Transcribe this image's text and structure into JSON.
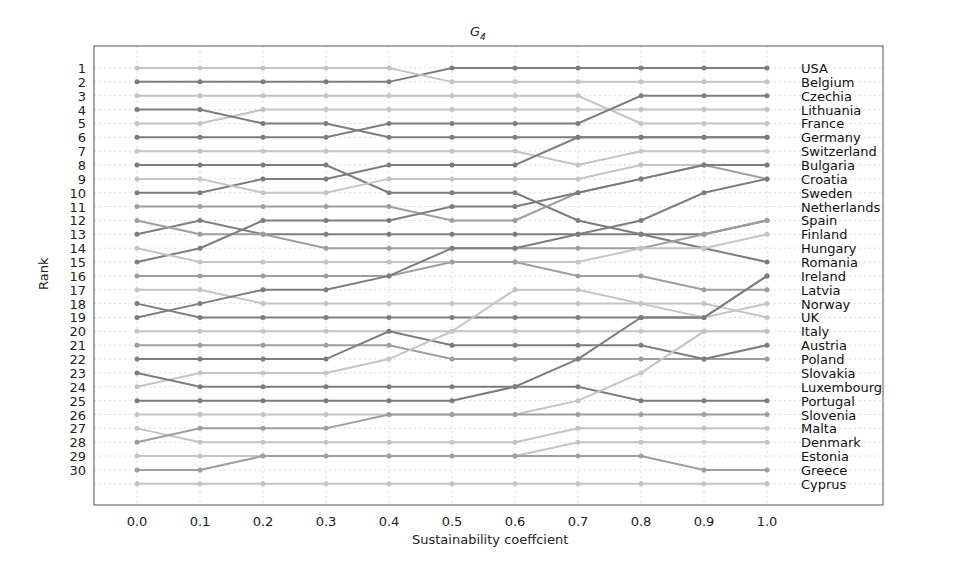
{
  "chart_data": {
    "type": "line",
    "title": "G4",
    "title_main": "G",
    "title_sub": "4",
    "xlabel": "Sustainability coeffcient",
    "ylabel": "Rank",
    "x": [
      0.0,
      0.1,
      0.2,
      0.3,
      0.4,
      0.5,
      0.6,
      0.7,
      0.8,
      0.9,
      1.0
    ],
    "x_tick_labels": [
      "0.0",
      "0.1",
      "0.2",
      "0.3",
      "0.4",
      "0.5",
      "0.6",
      "0.7",
      "0.8",
      "0.9",
      "1.0"
    ],
    "y_tick_labels": [
      "1",
      "2",
      "3",
      "4",
      "5",
      "6",
      "7",
      "8",
      "9",
      "10",
      "11",
      "12",
      "13",
      "14",
      "15",
      "16",
      "17",
      "18",
      "19",
      "20",
      "21",
      "22",
      "23",
      "24",
      "25",
      "26",
      "27",
      "28",
      "29",
      "30"
    ],
    "ylim": [
      1,
      31
    ],
    "y_inverted": true,
    "grid": true,
    "right_labels": [
      "USA",
      "Belgium",
      "Czechia",
      "Lithuania",
      "France",
      "Germany",
      "Switzerland",
      "Bulgaria",
      "Croatia",
      "Sweden",
      "Netherlands",
      "Spain",
      "Finland",
      "Hungary",
      "Romania",
      "Ireland",
      "Latvia",
      "Norway",
      "UK",
      "Italy",
      "Austria",
      "Poland",
      "Slovakia",
      "Luxembourg",
      "Portugal",
      "Slovenia",
      "Malta",
      "Denmark",
      "Estonia",
      "Greece",
      "Cyprus"
    ],
    "series": [
      {
        "name": "A",
        "shade": "dark",
        "values": [
          2,
          2,
          2,
          2,
          2,
          1,
          1,
          1,
          1,
          1,
          1
        ]
      },
      {
        "name": "B",
        "shade": "light",
        "values": [
          1,
          1,
          1,
          1,
          1,
          2,
          2,
          2,
          2,
          2,
          2
        ]
      },
      {
        "name": "C",
        "shade": "light",
        "values": [
          3,
          3,
          3,
          3,
          3,
          3,
          3,
          3,
          5,
          5,
          5
        ]
      },
      {
        "name": "D",
        "shade": "light",
        "values": [
          5,
          5,
          4,
          4,
          4,
          4,
          4,
          4,
          4,
          4,
          4
        ]
      },
      {
        "name": "E",
        "shade": "dark",
        "values": [
          4,
          4,
          5,
          5,
          6,
          6,
          6,
          6,
          6,
          6,
          6
        ]
      },
      {
        "name": "F",
        "shade": "dark",
        "values": [
          6,
          6,
          6,
          6,
          5,
          5,
          5,
          5,
          3,
          3,
          3
        ]
      },
      {
        "name": "G",
        "shade": "light",
        "values": [
          7,
          7,
          7,
          7,
          7,
          7,
          7,
          8,
          7,
          7,
          7
        ]
      },
      {
        "name": "H",
        "shade": "dark",
        "values": [
          8,
          8,
          8,
          8,
          10,
          10,
          10,
          12,
          13,
          14,
          15
        ]
      },
      {
        "name": "I",
        "shade": "dark",
        "values": [
          10,
          10,
          9,
          9,
          8,
          8,
          8,
          6,
          6,
          6,
          6
        ]
      },
      {
        "name": "J",
        "shade": "light",
        "values": [
          9,
          9,
          10,
          10,
          9,
          9,
          9,
          9,
          8,
          8,
          8
        ]
      },
      {
        "name": "K",
        "shade": "medium",
        "values": [
          11,
          11,
          11,
          11,
          11,
          12,
          12,
          10,
          9,
          8,
          9
        ]
      },
      {
        "name": "L",
        "shade": "dark",
        "values": [
          13,
          12,
          13,
          13,
          13,
          13,
          13,
          13,
          13,
          13,
          12
        ]
      },
      {
        "name": "M",
        "shade": "medium",
        "values": [
          12,
          13,
          13,
          14,
          14,
          14,
          14,
          14,
          14,
          13,
          12
        ]
      },
      {
        "name": "N",
        "shade": "dark",
        "values": [
          15,
          14,
          12,
          12,
          12,
          11,
          11,
          10,
          9,
          8,
          8
        ]
      },
      {
        "name": "O",
        "shade": "light",
        "values": [
          14,
          15,
          15,
          15,
          15,
          15,
          15,
          15,
          14,
          14,
          13
        ]
      },
      {
        "name": "P",
        "shade": "medium",
        "values": [
          16,
          16,
          16,
          16,
          16,
          15,
          15,
          16,
          16,
          17,
          17
        ]
      },
      {
        "name": "Q",
        "shade": "light",
        "values": [
          17,
          17,
          18,
          18,
          18,
          18,
          18,
          18,
          18,
          18,
          19
        ]
      },
      {
        "name": "R",
        "shade": "dark",
        "values": [
          19,
          18,
          17,
          17,
          16,
          14,
          14,
          13,
          12,
          10,
          9
        ]
      },
      {
        "name": "S",
        "shade": "dark",
        "values": [
          18,
          19,
          19,
          19,
          19,
          19,
          19,
          19,
          19,
          19,
          16
        ]
      },
      {
        "name": "T",
        "shade": "light",
        "values": [
          20,
          20,
          20,
          20,
          20,
          20,
          17,
          17,
          18,
          19,
          18
        ]
      },
      {
        "name": "U",
        "shade": "medium",
        "values": [
          21,
          21,
          21,
          21,
          21,
          22,
          22,
          22,
          22,
          22,
          22
        ]
      },
      {
        "name": "V",
        "shade": "dark",
        "values": [
          22,
          22,
          22,
          22,
          20,
          21,
          21,
          21,
          21,
          22,
          21
        ]
      },
      {
        "name": "W",
        "shade": "light",
        "values": [
          24,
          23,
          23,
          23,
          22,
          20,
          20,
          20,
          20,
          20,
          20
        ]
      },
      {
        "name": "X",
        "shade": "dark",
        "values": [
          23,
          24,
          24,
          24,
          24,
          24,
          24,
          22,
          19,
          19,
          16
        ]
      },
      {
        "name": "Y",
        "shade": "dark",
        "values": [
          25,
          25,
          25,
          25,
          25,
          25,
          24,
          24,
          25,
          25,
          25
        ]
      },
      {
        "name": "Z",
        "shade": "light",
        "values": [
          26,
          26,
          26,
          26,
          26,
          26,
          26,
          25,
          23,
          20,
          20
        ]
      },
      {
        "name": "AA",
        "shade": "light",
        "values": [
          27,
          28,
          28,
          28,
          28,
          28,
          28,
          27,
          27,
          27,
          27
        ]
      },
      {
        "name": "AB",
        "shade": "medium",
        "values": [
          28,
          27,
          27,
          27,
          26,
          26,
          26,
          26,
          26,
          26,
          26
        ]
      },
      {
        "name": "AC",
        "shade": "light",
        "values": [
          29,
          29,
          29,
          29,
          29,
          29,
          29,
          28,
          28,
          28,
          28
        ]
      },
      {
        "name": "AD",
        "shade": "medium",
        "values": [
          30,
          30,
          29,
          29,
          29,
          29,
          29,
          29,
          29,
          30,
          30
        ]
      },
      {
        "name": "AE",
        "shade": "light",
        "values": [
          31,
          31,
          31,
          31,
          31,
          31,
          31,
          31,
          31,
          31,
          31
        ]
      }
    ],
    "colors": {
      "dark": "#7d7d7d",
      "medium": "#9e9e9e",
      "light": "#c4c4c4",
      "grid": "#dddddd",
      "frame": "#555555"
    }
  }
}
